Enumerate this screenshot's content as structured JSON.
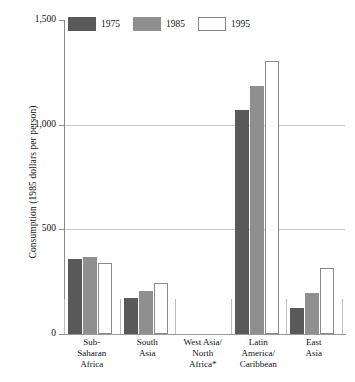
{
  "chart_data": {
    "type": "bar",
    "title": "",
    "xlabel": "",
    "ylabel": "Consumption (1985 dollars per person)",
    "ylim": [
      0,
      1500
    ],
    "yticks": [
      "0",
      "500",
      "1,000",
      "1,500"
    ],
    "ytick_values": [
      0,
      500,
      1000,
      1500
    ],
    "grid": "horizontal",
    "legend_position": "top-left",
    "categories": [
      "Sub-\nSaharan\nAfrica",
      "South\nAsia",
      "West Asia/\nNorth\nAfrica*",
      "Latin\nAmerica/\nCaribbean",
      "East\nAsia"
    ],
    "series": [
      {
        "name": "1975",
        "color": "#595959",
        "values": [
          359,
          172,
          null,
          1072,
          124
        ]
      },
      {
        "name": "1985",
        "color": "#8f8f8f",
        "values": [
          368,
          206,
          null,
          1187,
          196
        ]
      },
      {
        "name": "1995",
        "color": "#ffffff",
        "values": [
          340,
          244,
          null,
          1306,
          316
        ]
      }
    ],
    "footnote_marker": "*"
  },
  "legend": {
    "items": [
      {
        "label": "1975",
        "swatch": "dark-gray-swatch"
      },
      {
        "label": "1985",
        "swatch": "medium-gray-swatch"
      },
      {
        "label": "1995",
        "swatch": "white-swatch"
      }
    ]
  },
  "axis": {
    "y_title": "Consumption (1985 dollars per person)"
  },
  "colors": {
    "series_1975": "#595959",
    "series_1985": "#8f8f8f",
    "series_1995": "#ffffff",
    "gridline": "#c9c9c9",
    "axis": "#8a8a8a",
    "text": "#111111",
    "background": "#ffffff"
  }
}
